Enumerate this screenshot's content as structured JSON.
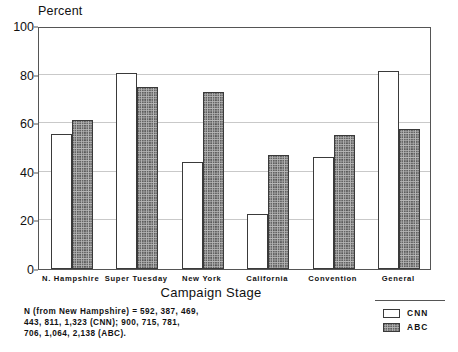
{
  "chart_data": {
    "type": "bar",
    "title": "",
    "xlabel": "Campaign Stage",
    "ylabel": "Percent",
    "ylim": [
      0,
      100
    ],
    "yticks": [
      0,
      20,
      40,
      60,
      80,
      100
    ],
    "grid": true,
    "legend_position": "bottom-right",
    "categories": [
      "N. Hampshire",
      "Super Tuesday",
      "New York",
      "California",
      "Convention",
      "General"
    ],
    "series": [
      {
        "name": "CNN",
        "values": [
          55.5,
          80.5,
          44,
          22.5,
          46,
          81.5
        ]
      },
      {
        "name": "ABC",
        "values": [
          61.5,
          75,
          73,
          47,
          55,
          57.5
        ]
      }
    ],
    "annotations": [
      "N (from New Hampshire) = 592, 387, 469,",
      "443, 811, 1,323 (CNN); 900, 715, 781,",
      "706, 1,064, 2,138 (ABC)."
    ],
    "colors": {
      "cnn": "#ffffff",
      "abc": "#b7b7b7",
      "outline": "#3a3a3a",
      "grid": "#c9c9c9"
    }
  }
}
